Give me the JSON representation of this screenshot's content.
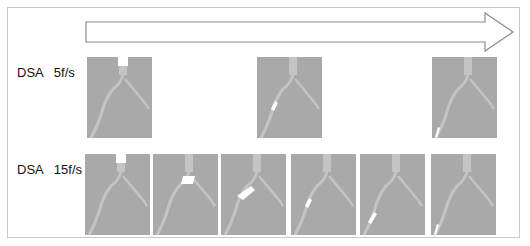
{
  "title_arrow": {
    "direction": "right",
    "meaning": "time"
  },
  "rows": [
    {
      "label": "DSA   5f/s",
      "frames": [
        {
          "x": 87,
          "marker": "top"
        },
        {
          "x": 257,
          "marker": "left-mid"
        },
        {
          "x": 432,
          "marker": "left-bottom"
        }
      ]
    },
    {
      "label": "DSA   15f/s",
      "frames": [
        {
          "x": 85,
          "marker": "top"
        },
        {
          "x": 153,
          "marker": "top-wide"
        },
        {
          "x": 221,
          "marker": "bifurcation"
        },
        {
          "x": 291,
          "marker": "left-mid"
        },
        {
          "x": 360,
          "marker": "left-low"
        },
        {
          "x": 431,
          "marker": "left-bottom"
        }
      ]
    }
  ],
  "colors": {
    "panel": "#a9a9a9",
    "vessel": "#c4c4c4",
    "frame": "#c8c8c8"
  }
}
